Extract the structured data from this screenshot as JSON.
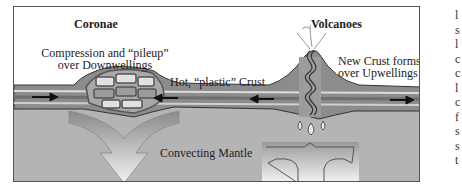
{
  "diagram": {
    "titles": {
      "left": "Coronae",
      "right": "Volcanoes"
    },
    "labels": {
      "compression_line1": "Compression and “pileup”",
      "compression_line2": "over Downwellings",
      "hot_crust": "Hot, “plastic” Crust",
      "new_crust_line1": "New Crust forms",
      "new_crust_line2": "over Upwellings",
      "mantle": "Convecting Mantle"
    },
    "colors": {
      "crust_dark": "#6e6e6e",
      "crust_mid": "#8c8c8c",
      "crust_light": "#d8d8d8",
      "mantle": "#b4b4b4",
      "outline": "#333333"
    }
  },
  "side_text": [
    "l",
    "s",
    "l",
    "c",
    "c",
    "l",
    "c",
    "f",
    "s",
    "s",
    "t"
  ]
}
